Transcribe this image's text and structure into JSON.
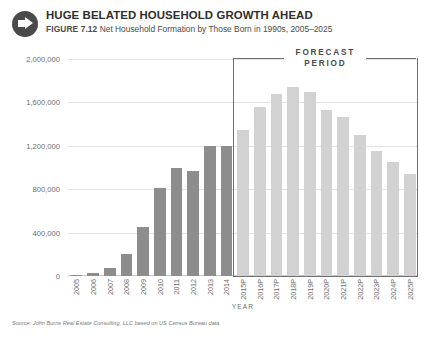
{
  "header": {
    "icon": "arrow-right-circle-icon",
    "title": "HUGE BELATED HOUSEHOLD GROWTH AHEAD",
    "figure_number": "FIGURE 7.12",
    "figure_description": "Net Household Formation by Those Born in 1990s, 2005–2025"
  },
  "annotations": {
    "forecast_label_line1": "FORECAST",
    "forecast_label_line2": "PERIOD"
  },
  "source_note": "Source: John Burns Real Estate Consulting, LLC based on US Census Bureau data",
  "colors": {
    "historical_bar": "#8d8d8d",
    "forecast_bar": "#d2d2d2",
    "gridline": "#e3e3e3",
    "forecast_box_border": "#6f6f6f",
    "badge": "#4a4a4a",
    "text": "#3a3a3a",
    "axis_text": "#6d6d6d"
  },
  "chart_data": {
    "type": "bar",
    "title": "HUGE BELATED HOUSEHOLD GROWTH AHEAD",
    "subtitle": "Net Household Formation by Those Born in 1990s, 2005–2025",
    "xlabel": "YEAR",
    "ylabel": "NUMBER OF HOUSEHOLDS",
    "ylim": [
      0,
      2000000
    ],
    "ytick_values": [
      0,
      400000,
      800000,
      1200000,
      1600000,
      2000000
    ],
    "ytick_labels": [
      "0",
      "400,000",
      "800,000",
      "1,200,000",
      "1,600,000",
      "2,000,000"
    ],
    "grid": true,
    "legend": "none",
    "categories": [
      "2005",
      "2006",
      "2007",
      "2008",
      "2009",
      "2010",
      "2011",
      "2012",
      "2013",
      "2014",
      "2015P",
      "2016P",
      "2017P",
      "2018P",
      "2019P",
      "2020P",
      "2021P",
      "2022P",
      "2023P",
      "2024P",
      "2025P"
    ],
    "values": [
      10000,
      25000,
      70000,
      200000,
      450000,
      810000,
      1000000,
      970000,
      1200000,
      1200000,
      1350000,
      1560000,
      1680000,
      1740000,
      1700000,
      1530000,
      1470000,
      1300000,
      1150000,
      1050000,
      940000
    ],
    "series_groups": [
      {
        "name": "Actual",
        "color": "#8d8d8d",
        "category_range": [
          0,
          9
        ]
      },
      {
        "name": "Forecast",
        "color": "#d2d2d2",
        "category_range": [
          10,
          20
        ]
      }
    ],
    "annotations": [
      {
        "text": "FORECAST PERIOD",
        "type": "bracket-box",
        "covers_categories": [
          "2015P",
          "2025P"
        ]
      }
    ]
  }
}
